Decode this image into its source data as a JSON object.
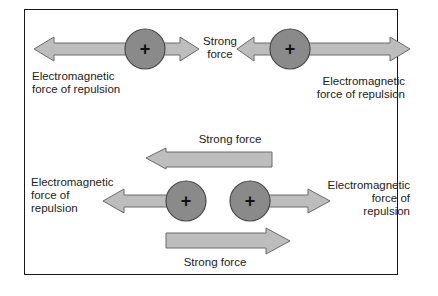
{
  "diagram": {
    "top": {
      "left_em_label": [
        "Electromagnetic",
        "force of repulsion"
      ],
      "strong_label": [
        "Strong",
        "force"
      ],
      "right_em_label": [
        "Electromagnetic",
        "force of repulsion"
      ],
      "proton_symbol": "+"
    },
    "bottom": {
      "strong_top_label": "Strong force",
      "strong_bottom_label": "Strong force",
      "left_em_label": [
        "Electromagnetic",
        "force of",
        "repulsion"
      ],
      "right_em_label": [
        "Electromagnetic",
        "force of",
        "repulsion"
      ],
      "proton_symbol": "+"
    },
    "colors": {
      "arrow_fill": "#bdbdbd",
      "arrow_stroke": "#6a6a6a",
      "proton_fill": "#8a8a8a",
      "proton_stroke": "#4a4a4a",
      "frame": "#1a1a1a"
    }
  }
}
